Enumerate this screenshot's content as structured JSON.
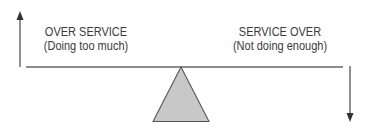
{
  "diagram": {
    "left_label": {
      "title": "OVER SERVICE",
      "subtitle": "(Doing too much)"
    },
    "right_label": {
      "title": "SERVICE OVER",
      "subtitle": "(Not doing enough)"
    },
    "left_arrow": {
      "direction": "up",
      "icon": "arrow-up-icon"
    },
    "right_arrow": {
      "direction": "down",
      "icon": "arrow-down-icon"
    },
    "fulcrum": {
      "shape": "triangle",
      "fill": "#c8c8c8"
    },
    "beam": {
      "shape": "line"
    },
    "colors": {
      "line": "#555555",
      "text": "#3a3a3a",
      "fulcrum_fill": "#c8c8c8",
      "background": "#ffffff"
    }
  }
}
